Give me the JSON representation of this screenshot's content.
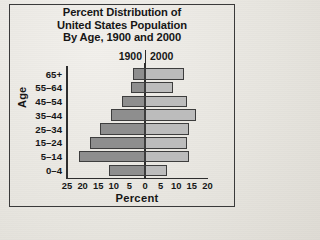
{
  "chart_data": {
    "type": "bar",
    "title": "Percent Distribution of United States Population By Age, 1900 and 2000",
    "title_lines": [
      "Percent Distribution of",
      "United States Population",
      "By Age, 1900 and 2000"
    ],
    "xlabel": "Percent",
    "ylabel": "Age",
    "orientation": "horizontal",
    "subtype": "population-pyramid",
    "grid": false,
    "legend_position": "top-center",
    "categories": [
      "65+",
      "55–64",
      "45–54",
      "35–44",
      "25–34",
      "15–24",
      "5–14",
      "0–4"
    ],
    "series": [
      {
        "name": "1900",
        "side": "left",
        "color": "#8e8e8e",
        "values": [
          4,
          4.5,
          7.5,
          11,
          14.5,
          17.5,
          21,
          11.5
        ]
      },
      {
        "name": "2000",
        "side": "right",
        "color": "#bcbcbc",
        "values": [
          12.5,
          9,
          13.5,
          16.5,
          14,
          13.5,
          14,
          7
        ]
      }
    ],
    "xticks_left": [
      25,
      20,
      15,
      10,
      5
    ],
    "xtick_center": [
      0
    ],
    "xticks_right": [
      5,
      10,
      15,
      20
    ],
    "xlim_left": 25,
    "xlim_right": 20,
    "xtick_labels": [
      "25",
      "20",
      "15",
      "10",
      "5",
      "0",
      "5",
      "10",
      "15",
      "20"
    ]
  },
  "legend": {
    "left_label": "1900",
    "right_label": "2000"
  }
}
